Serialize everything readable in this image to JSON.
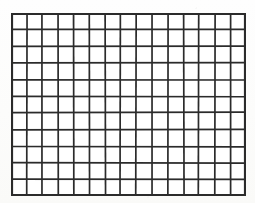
{
  "figure": {
    "kind": "blank-grid",
    "title": "",
    "caption": ""
  },
  "grid": {
    "columns": 15,
    "rows": 11,
    "cell_count": 165,
    "cell_width_px": 15.7,
    "cell_height_px": 16.6,
    "origin_x_px": 11,
    "origin_y_px": 13,
    "width_px": 235,
    "height_px": 183,
    "cells_are_empty": true
  },
  "style": {
    "line_color": "#2b2b2b",
    "line_width_inner_px": 1.7,
    "line_width_border_px": 2.2,
    "cell_fill": "#ffffff",
    "page_background": "#fdfdfc",
    "border_drawn": true
  },
  "labels": {
    "row_labels": [],
    "column_labels": [],
    "axis_labels": []
  },
  "content": {
    "cell_values": [],
    "annotations": [],
    "shaded_cells": []
  }
}
